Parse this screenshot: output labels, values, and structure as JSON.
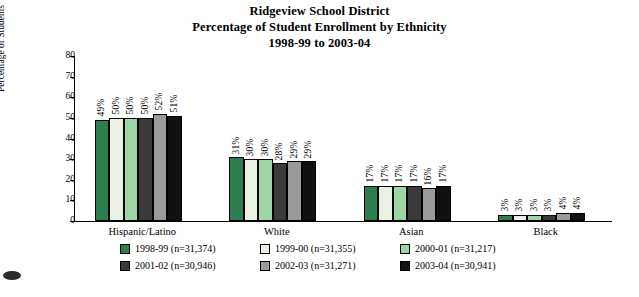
{
  "title": {
    "line1": "Ridgeview School District",
    "line2": "Percentage of Student Enrollment by Ethnicity",
    "line3": "1998-99 to 2003-04"
  },
  "chart_data": {
    "type": "bar",
    "title": "Ridgeview School District Percentage of Student Enrollment by Ethnicity 1998-99 to 2003-04",
    "xlabel": "",
    "ylabel": "Percentage of Students",
    "ylim": [
      0,
      80
    ],
    "yticks": [
      "0",
      "10",
      "20",
      "30",
      "40",
      "50",
      "60",
      "70",
      "80"
    ],
    "grid": false,
    "legend_position": "bottom",
    "categories": [
      "Hispanic/Latino",
      "White",
      "Asian",
      "Black"
    ],
    "series": [
      {
        "name": "1998-99 (n=31,374)",
        "color": "#2e7d4f",
        "values": [
          49,
          31,
          17,
          3
        ],
        "labels": [
          "49%",
          "31%",
          "17%",
          "3%"
        ]
      },
      {
        "name": "1999-00 (n=31,355)",
        "color": "#e7f2e4",
        "values": [
          50,
          30,
          17,
          3
        ],
        "labels": [
          "50%",
          "30%",
          "17%",
          "3%"
        ]
      },
      {
        "name": "2000-01 (n=31,217)",
        "color": "#9ed5a6",
        "values": [
          50,
          30,
          17,
          3
        ],
        "labels": [
          "50%",
          "30%",
          "17%",
          "3%"
        ]
      },
      {
        "name": "2001-02 (n=30,946)",
        "color": "#3a3a3a",
        "values": [
          50,
          28,
          17,
          3
        ],
        "labels": [
          "50%",
          "28%",
          "17%",
          "3%"
        ]
      },
      {
        "name": "2002-03 (n=31,271)",
        "color": "#9a9a9a",
        "values": [
          52,
          29,
          16,
          4
        ],
        "labels": [
          "52%",
          "29%",
          "16%",
          "4%"
        ]
      },
      {
        "name": "2003-04 (n=30,941)",
        "color": "#111111",
        "values": [
          51,
          29,
          17,
          4
        ],
        "labels": [
          "51%",
          "29%",
          "17%",
          "4%"
        ]
      }
    ]
  }
}
